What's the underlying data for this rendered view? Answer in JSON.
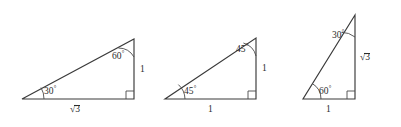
{
  "figure": {
    "background_color": "#ffffff",
    "line_color": "#3a3a3a",
    "text_color": "#2b2b2b",
    "width": 401,
    "height": 127
  },
  "triangles": [
    {
      "id": "triangle-1",
      "name": "30-60-90 triangle with legs sqrt(3) and 1",
      "vertices": {
        "bottom_left": [
          22,
          99
        ],
        "bottom_right": [
          134,
          99
        ],
        "apex": [
          134,
          39
        ]
      },
      "angles": {
        "bottom_left": "30",
        "top_right": "60",
        "bottom_right": "90"
      },
      "labels": {
        "base": "√3",
        "vertical": "1",
        "angle_bottom_left": "30",
        "angle_top_right": "60",
        "degree_symbol": "°"
      }
    },
    {
      "id": "triangle-2",
      "name": "45-45-90 triangle with legs 1 and 1",
      "vertices": {
        "bottom_left": [
          165,
          99
        ],
        "bottom_right": [
          256,
          99
        ],
        "apex": [
          256,
          38
        ]
      },
      "angles": {
        "bottom_left": "45",
        "top_right": "45",
        "bottom_right": "90"
      },
      "labels": {
        "base": "1",
        "vertical": "1",
        "angle_bottom_left": "45",
        "angle_top_right": "45",
        "degree_symbol": "°"
      }
    },
    {
      "id": "triangle-3",
      "name": "30-60-90 triangle with legs 1 and sqrt(3)",
      "vertices": {
        "bottom_left": [
          303,
          99
        ],
        "bottom_right": [
          355,
          99
        ],
        "apex": [
          355,
          15
        ]
      },
      "angles": {
        "bottom_left": "60",
        "top_right": "30",
        "bottom_right": "90"
      },
      "labels": {
        "base": "1",
        "vertical": "√3",
        "angle_bottom_left": "60",
        "angle_top_right": "30",
        "degree_symbol": "°"
      }
    }
  ]
}
